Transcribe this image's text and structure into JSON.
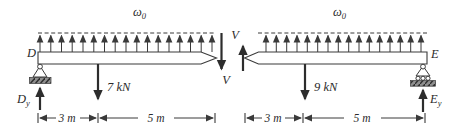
{
  "figure_type": "beam-section-free-body-diagram",
  "colors": {
    "ink": "#3a3a3a",
    "paper": "#ffffff",
    "ground_hatch": "#8f8f8f"
  },
  "left_beam": {
    "dist_load": {
      "symbol": "ω",
      "subscript": "0"
    },
    "end_label": "D",
    "reaction": {
      "symbol": "D",
      "subscript": "y"
    },
    "point_load": "7 kN",
    "shear_force": "V",
    "dims": {
      "left": "3 m",
      "right": "5 m"
    }
  },
  "right_beam": {
    "dist_load": {
      "symbol": "ω",
      "subscript": "0"
    },
    "end_label": "E",
    "reaction": {
      "symbol": "E",
      "subscript": "y"
    },
    "point_load": "9 kN",
    "shear_force": "V",
    "dims": {
      "left": "3 m",
      "right": "5 m"
    }
  }
}
